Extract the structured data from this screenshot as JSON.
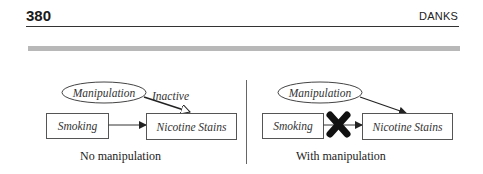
{
  "header": {
    "page_number": "380",
    "running_head": "DANKS"
  },
  "figure": {
    "left_panel": {
      "caption": "No manipulation",
      "manipulation_node": "Manipulation",
      "cause_node": "Smoking",
      "effect_node": "Nicotine Stains",
      "manipulation_edge_label": "Inactive"
    },
    "right_panel": {
      "caption": "With manipulation",
      "manipulation_node": "Manipulation",
      "cause_node": "Smoking",
      "effect_node": "Nicotine Stains",
      "blocked_marker": "X"
    }
  },
  "colors": {
    "text": "#222222",
    "rule": "#333333",
    "gray_bar": "#b8b8b8",
    "diagram_stroke": "#444444"
  }
}
